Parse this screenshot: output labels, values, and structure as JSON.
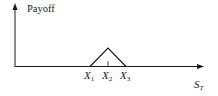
{
  "diagram": {
    "type": "payoff-diagram",
    "y_axis_label": "Payoff",
    "x_axis_label": "S",
    "x_axis_label_sub": "T",
    "strikes": [
      {
        "main": "X",
        "sub": "1"
      },
      {
        "main": "X",
        "sub": "2"
      },
      {
        "main": "X",
        "sub": "3"
      }
    ],
    "shape": "triangle peaking at X2, zero outside X1–X3",
    "colors": {
      "line": "#1a1a1a",
      "background": "#ffffff"
    }
  }
}
